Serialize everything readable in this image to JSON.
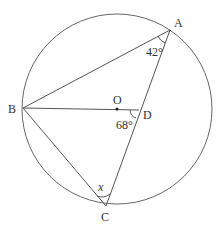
{
  "diagram": {
    "type": "circle-geometry",
    "circle": {
      "center": "O",
      "cx": 117,
      "cy": 109,
      "r": 95
    },
    "points": {
      "A": {
        "label": "A",
        "x": 170,
        "y": 30
      },
      "B": {
        "label": "B",
        "x": 23,
        "y": 108
      },
      "C": {
        "label": "C",
        "x": 106,
        "y": 206
      },
      "D": {
        "label": "D",
        "x": 139,
        "y": 110
      },
      "O": {
        "label": "O",
        "x": 117,
        "y": 109
      }
    },
    "segments": [
      "AB",
      "BD",
      "BC",
      "AC"
    ],
    "angles": {
      "BAC": {
        "label": "42°"
      },
      "BDC": {
        "label": "68°"
      },
      "BCA": {
        "label": "x"
      }
    },
    "stroke_color": "#555555"
  }
}
